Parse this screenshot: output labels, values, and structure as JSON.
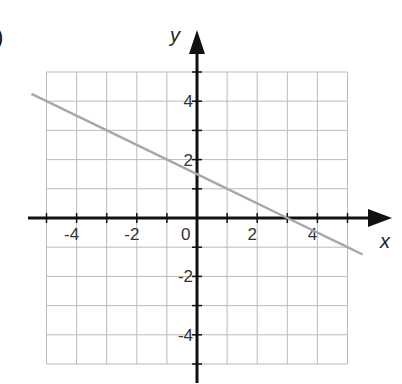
{
  "panel_label": ")",
  "chart_data": {
    "type": "line",
    "title": "",
    "xlabel": "x",
    "ylabel": "y",
    "xlim": [
      -5,
      5
    ],
    "ylim": [
      -5,
      5
    ],
    "grid": true,
    "grid_step": 1,
    "x_ticks": [
      -4,
      -2,
      0,
      2,
      4
    ],
    "y_ticks": [
      -4,
      -2,
      2,
      4
    ],
    "x_tick_labels": [
      "-4",
      "-2",
      "0",
      "2",
      "4"
    ],
    "y_tick_labels": [
      "-4",
      "-2",
      "2",
      "4"
    ],
    "series": [
      {
        "name": "line",
        "equation": "y = -0.5x + 1.5",
        "color": "#a8a8a8",
        "x": [
          -5.5,
          -5,
          0,
          3,
          5,
          5.5
        ],
        "y": [
          4.25,
          4,
          1.5,
          0,
          -1,
          -1.25
        ]
      }
    ]
  }
}
